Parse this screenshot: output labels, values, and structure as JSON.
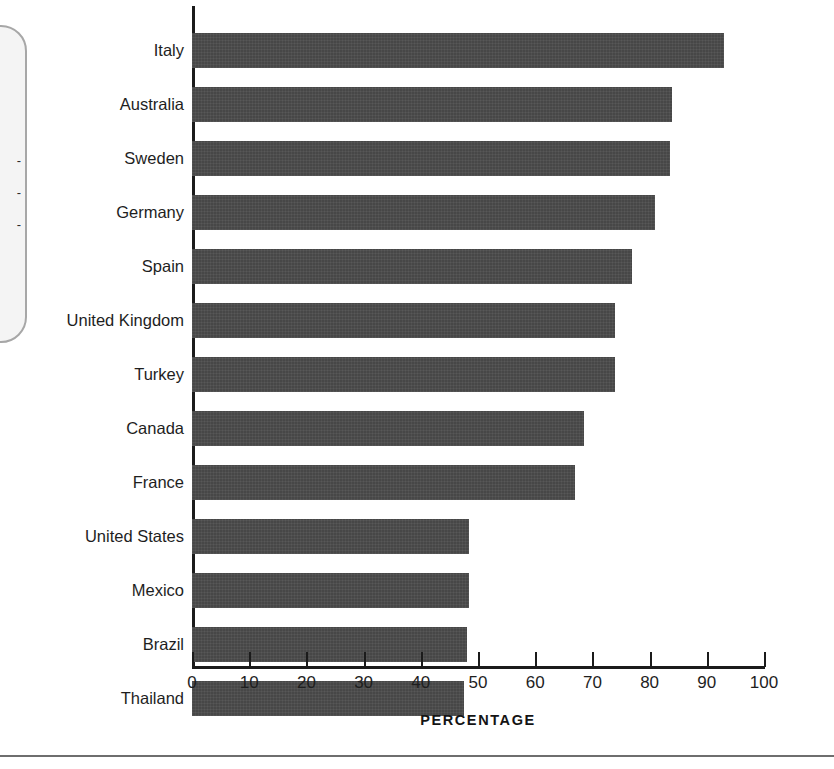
{
  "callout": {
    "fragment_lines": "-\n-\n-",
    "note": "partially visible rounded callout box cropped at left edge"
  },
  "chart_data": {
    "type": "bar",
    "orientation": "horizontal",
    "title": "",
    "subtitle": "",
    "xlabel": "PERCENTAGE",
    "ylabel": "",
    "xlim": [
      0,
      100
    ],
    "xticks": [
      0,
      10,
      20,
      30,
      40,
      50,
      60,
      70,
      80,
      90,
      100
    ],
    "xtick_labels": [
      "0",
      "10",
      "20",
      "30",
      "40",
      "50",
      "60",
      "70",
      "80",
      "90",
      "100"
    ],
    "grid": false,
    "legend": null,
    "bar_color": "#474747",
    "axis_color": "#1b1b1b",
    "categories": [
      "Italy",
      "Australia",
      "Sweden",
      "Germany",
      "Spain",
      "United Kingdom",
      "Turkey",
      "Canada",
      "France",
      "United States",
      "Mexico",
      "Brazil",
      "Thailand"
    ],
    "values": [
      93,
      84,
      83.5,
      81,
      77,
      74,
      74,
      68.5,
      67,
      48.5,
      48.5,
      48,
      47.5
    ],
    "series": [
      {
        "name": "Percentage",
        "values": [
          93,
          84,
          83.5,
          81,
          77,
          74,
          74,
          68.5,
          67,
          48.5,
          48.5,
          48,
          47.5
        ]
      }
    ]
  }
}
